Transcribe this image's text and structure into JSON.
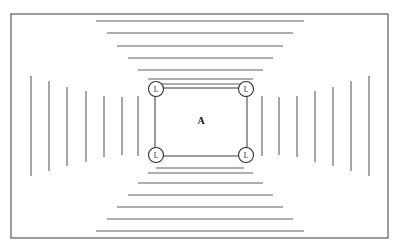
{
  "figure": {
    "background_color": "#ffffff",
    "line_color": "#5f5f5f",
    "frame_color": "#3a3a3a",
    "marker_color": "#2e2e2e",
    "width": 400,
    "height": 252
  },
  "frame": {
    "label": "outer-frame",
    "x": 11,
    "y": 14,
    "width": 377,
    "height": 224
  },
  "center_label": {
    "text": "A"
  },
  "corner_markers": [
    {
      "text": "L",
      "position": "top-left",
      "cx": 156,
      "cy": 89,
      "r": 7.5
    },
    {
      "text": "L",
      "position": "top-right",
      "cx": 246,
      "cy": 89,
      "r": 7.5
    },
    {
      "text": "L",
      "position": "bottom-left",
      "cx": 156,
      "cy": 155,
      "r": 7.5
    },
    {
      "text": "L",
      "position": "bottom-right",
      "cx": 246,
      "cy": 155,
      "r": 7.5
    }
  ],
  "inner_rect": {
    "label": "central-zone-A",
    "x": 155,
    "y": 88,
    "width": 92,
    "height": 68
  },
  "rings": [
    {
      "index": 1,
      "x": 31,
      "y": 21,
      "width": 338,
      "height": 210,
      "h_inset": 65,
      "v_inset": 55
    },
    {
      "index": 2,
      "x": 49,
      "y": 33,
      "width": 302,
      "height": 186,
      "h_inset": 58,
      "v_inset": 48
    },
    {
      "index": 3,
      "x": 67,
      "y": 46,
      "width": 266,
      "height": 161,
      "h_inset": 50,
      "v_inset": 41
    },
    {
      "index": 4,
      "x": 86,
      "y": 58,
      "width": 229,
      "height": 137,
      "h_inset": 42,
      "v_inset": 33
    },
    {
      "index": 5,
      "x": 104,
      "y": 70,
      "width": 193,
      "height": 113,
      "h_inset": 34,
      "v_inset": 26
    },
    {
      "index": 6,
      "x": 122,
      "y": 79,
      "width": 157,
      "height": 94,
      "h_inset": 26,
      "v_inset": 18
    },
    {
      "index": 7,
      "x": 138,
      "y": 84,
      "width": 124,
      "height": 84,
      "h_inset": 18,
      "v_inset": 12
    }
  ]
}
